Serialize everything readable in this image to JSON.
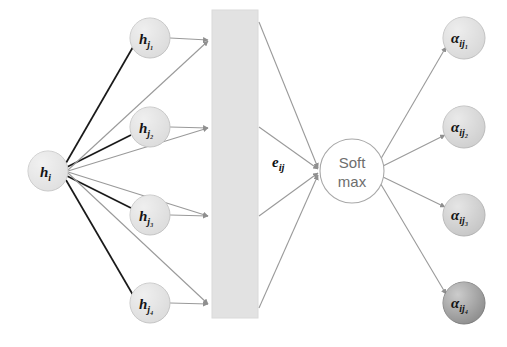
{
  "diagram": {
    "type": "neural-attention-mechanism-diagram",
    "background_color": "#ffffff",
    "source_node": {
      "id": "h-i",
      "label_main": "h",
      "label_sub": "i",
      "cx": 48,
      "cy": 171,
      "r": 20,
      "fill": "#e0e0e0",
      "stroke": "#c9c9c9"
    },
    "neighbor_nodes": [
      {
        "id": "h-j1",
        "label_main": "h",
        "label_sub": "j₁",
        "cx": 150,
        "cy": 38,
        "r": 20,
        "fill": "#dcdcdc",
        "stroke": "#c4c4c4"
      },
      {
        "id": "h-j2",
        "label_main": "h",
        "label_sub": "j₂",
        "cx": 150,
        "cy": 127,
        "r": 20,
        "fill": "#dcdcdc",
        "stroke": "#c4c4c4"
      },
      {
        "id": "h-j3",
        "label_main": "h",
        "label_sub": "j₃",
        "cx": 150,
        "cy": 215,
        "r": 20,
        "fill": "#dcdcdc",
        "stroke": "#c4c4c4"
      },
      {
        "id": "h-j4",
        "label_main": "h",
        "label_sub": "j₄",
        "cx": 150,
        "cy": 303,
        "r": 20,
        "fill": "#dcdcdc",
        "stroke": "#c4c4c4"
      }
    ],
    "attention_bar": {
      "id": "attention-bar",
      "x": 212,
      "y": 10,
      "width": 46,
      "height": 308,
      "fill": "#e2e2e2",
      "stroke": "#dadada"
    },
    "energy_label": {
      "id": "e-ij",
      "label_main": "e",
      "label_sub": "ij",
      "x": 272,
      "y": 167,
      "color": "#101010"
    },
    "softmax_node": {
      "id": "softmax",
      "line1": "Soft",
      "line2": "max",
      "cx": 352,
      "cy": 171,
      "r": 32,
      "fill": "#ffffff",
      "stroke": "#a8a8a8",
      "text_color": "#6e6e6e"
    },
    "attention_nodes": [
      {
        "id": "alpha-ij1",
        "label_main": "α",
        "label_sub": "ij₁",
        "cx": 464,
        "cy": 38,
        "r": 21,
        "fill": "#d8d8d8",
        "stroke": "#c0c0c0"
      },
      {
        "id": "alpha-ij2",
        "label_main": "α",
        "label_sub": "ij₂",
        "cx": 464,
        "cy": 127,
        "r": 21,
        "fill": "#cfcfcf",
        "stroke": "#bababa"
      },
      {
        "id": "alpha-ij3",
        "label_main": "α",
        "label_sub": "ij₃",
        "cx": 464,
        "cy": 215,
        "r": 21,
        "fill": "#c6c6c6",
        "stroke": "#b2b2b2"
      },
      {
        "id": "alpha-ij4",
        "label_main": "α",
        "label_sub": "ij₄",
        "cx": 464,
        "cy": 303,
        "r": 21,
        "fill": "#8e8e8e",
        "stroke": "#7c7c7c"
      }
    ],
    "edges": {
      "source_to_neighbor_color": "#1a1a1a",
      "source_to_bar_color": "#9a9a9a",
      "neighbor_to_bar_color": "#9a9a9a",
      "bar_to_softmax_color": "#9a9a9a",
      "softmax_to_attention_color": "#9a9a9a"
    }
  }
}
